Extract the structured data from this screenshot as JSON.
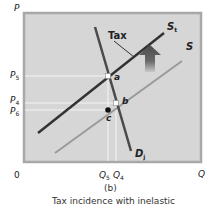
{
  "figure": {
    "panel_label": "(b)",
    "caption": "Tax incidence with inelastic",
    "colors": {
      "plot_background": "#d6d6d6",
      "frame": "#a8a8a8",
      "supply_with_tax": "#333333",
      "supply": "#9a9a9a",
      "demand": "#4a4a4a",
      "guide_lines": "#f4f4f4",
      "arrow": "#555555"
    }
  },
  "axes": {
    "y_label": "P",
    "x_label": "Q",
    "origin": "0",
    "y_ticks": [
      {
        "main": "P",
        "sub": "5"
      },
      {
        "main": "P",
        "sub": "4"
      },
      {
        "main": "P",
        "sub": "6"
      }
    ],
    "x_ticks": [
      {
        "main": "Q",
        "sub": "5"
      },
      {
        "main": "Q",
        "sub": "4"
      }
    ]
  },
  "curves": {
    "supply_tax": {
      "main": "S",
      "sub": "t"
    },
    "supply": {
      "main": "S"
    },
    "demand": {
      "main": "D",
      "sub": "j"
    }
  },
  "annotations": {
    "tax_label": "Tax",
    "points": [
      "a",
      "b",
      "c"
    ]
  }
}
